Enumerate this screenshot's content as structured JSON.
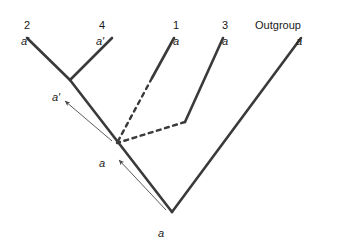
{
  "figure": {
    "type": "phylogenetic-tree-diagram",
    "background_color": "#ffffff",
    "line_color": "#3a3a3a",
    "dashed_line_color": "#3a3a3a",
    "arrow_color": "#4a4a4a",
    "text_color": "#1a1a1a"
  },
  "tips": [
    {
      "name": "2",
      "allele": "a′",
      "name_x": 27,
      "allele_x": 25,
      "tip_x": 27,
      "tip_y": 38
    },
    {
      "name": "4",
      "allele": "a′",
      "name_x": 102,
      "allele_x": 100,
      "tip_x": 112,
      "tip_y": 38
    },
    {
      "name": "1",
      "allele": "a",
      "name_x": 176,
      "allele_x": 176,
      "tip_x": 174,
      "tip_y": 38
    },
    {
      "name": "3",
      "allele": "a",
      "name_x": 225,
      "allele_x": 225,
      "tip_x": 223,
      "tip_y": 38
    },
    {
      "name": "Outgroup",
      "allele": "a",
      "name_x": 278,
      "allele_x": 299,
      "tip_x": 301,
      "tip_y": 38
    }
  ],
  "rows": {
    "taxon_label_y": 20,
    "allele_label_y": 36
  },
  "internal_nodes": [
    {
      "id": "node-24",
      "allele": "a′",
      "x": 70,
      "y": 80,
      "label_x": 52,
      "label_y": 92
    },
    {
      "id": "node-13",
      "allele": "a",
      "x": 117,
      "y": 143,
      "label_x": 99,
      "label_y": 158
    },
    {
      "id": "node-root",
      "allele": "a",
      "x": 172,
      "y": 212,
      "label_x": 158,
      "label_y": 228
    }
  ],
  "branches": [
    {
      "id": "branch-taxon-2",
      "style": "solid",
      "x1": 27,
      "y1": 38,
      "x2": 70,
      "y2": 80
    },
    {
      "id": "branch-taxon-4",
      "style": "solid",
      "x1": 112,
      "y1": 38,
      "x2": 70,
      "y2": 80
    },
    {
      "id": "branch-backbone",
      "style": "solid",
      "x1": 70,
      "y1": 80,
      "x2": 172,
      "y2": 212
    },
    {
      "id": "branch-taxon-1-solid",
      "style": "solid",
      "x1": 174,
      "y1": 38,
      "x2": 152,
      "y2": 78
    },
    {
      "id": "branch-taxon-1-dashed",
      "style": "dashed",
      "x1": 152,
      "y1": 78,
      "x2": 117,
      "y2": 143
    },
    {
      "id": "branch-taxon-3-solid",
      "style": "solid",
      "x1": 223,
      "y1": 38,
      "x2": 185,
      "y2": 122
    },
    {
      "id": "branch-taxon-3-dashed",
      "style": "dashed",
      "x1": 185,
      "y1": 122,
      "x2": 117,
      "y2": 143
    },
    {
      "id": "branch-outgroup",
      "style": "solid",
      "x1": 301,
      "y1": 38,
      "x2": 172,
      "y2": 212
    }
  ],
  "arrows": [
    {
      "id": "arrow-upper",
      "from_x": 112,
      "from_y": 141,
      "to_x": 65,
      "to_y": 101
    },
    {
      "id": "arrow-lower",
      "from_x": 166,
      "from_y": 210,
      "to_x": 119,
      "to_y": 160
    }
  ]
}
